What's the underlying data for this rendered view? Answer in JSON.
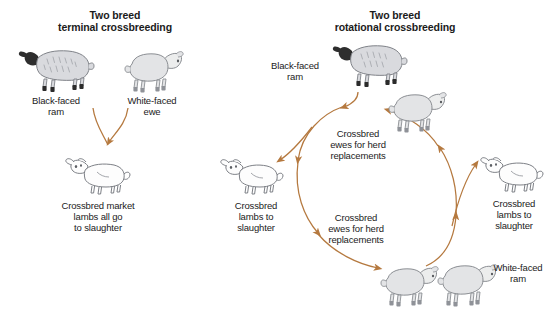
{
  "diagram": {
    "type": "flow-diagram",
    "arrow_color": "#b5793f",
    "background": "#ffffff",
    "panels": [
      {
        "id": "terminal",
        "title": "Two breed\nterminal crossbreeding",
        "animals": [
          {
            "name": "black-faced-ram",
            "label": "Black-faced\nram",
            "kind": "ram",
            "face": "black",
            "facing": "left"
          },
          {
            "name": "white-faced-ewe",
            "label": "White-faced\newe",
            "kind": "ewe",
            "face": "white",
            "facing": "right"
          },
          {
            "name": "crossbred-market-lambs",
            "label": "Crossbred market\nlambs all go\nto slaughter",
            "kind": "lamb",
            "face": "spotted",
            "facing": "left"
          }
        ],
        "flow": "Black-faced ram x White-faced ewe produce crossbred market lambs that all go to slaughter"
      },
      {
        "id": "rotational",
        "title": "Two breed\nrotational crossbreeding",
        "animals": [
          {
            "name": "black-faced-ram",
            "label": "Black-faced\nram",
            "kind": "ram",
            "face": "black",
            "facing": "left"
          },
          {
            "name": "crossbred-ewe-upper",
            "label": "",
            "kind": "ewe",
            "face": "white",
            "facing": "right"
          },
          {
            "name": "crossbred-lambs-left",
            "label": "Crossbred\nlambs to\nslaughter",
            "kind": "lamb",
            "face": "spotted",
            "facing": "left"
          },
          {
            "name": "crossbred-lambs-right",
            "label": "Crossbred\nlambs to\nslaughter",
            "kind": "lamb",
            "face": "spotted",
            "facing": "left"
          },
          {
            "name": "crossbred-ewe-lower",
            "label": "",
            "kind": "ewe",
            "face": "white",
            "facing": "right"
          },
          {
            "name": "white-faced-ram",
            "label": "White-faced\nram",
            "kind": "ram",
            "face": "white",
            "facing": "right"
          }
        ],
        "cycle_labels": [
          {
            "name": "cycle-label-upper",
            "text": "Crossbred\newes for herd\nreplacements"
          },
          {
            "name": "cycle-label-lower",
            "text": "Crossbred\newes for herd\nreplacements"
          }
        ],
        "flow": "Black-faced ram mates with flock producing crossbred ewes for herd replacements and crossbred lambs to slaughter; retained crossbred ewes are then mated to a White-faced ram, repeating the rotation"
      }
    ]
  }
}
